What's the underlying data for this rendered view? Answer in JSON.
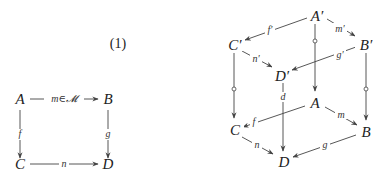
{
  "equation_number": "(1)",
  "square": {
    "nodes": {
      "A": {
        "label": "A",
        "x": 20,
        "y": 104
      },
      "B": {
        "label": "B",
        "x": 108,
        "y": 104
      },
      "C": {
        "label": "C",
        "x": 20,
        "y": 169
      },
      "D": {
        "label": "D",
        "x": 108,
        "y": 169
      }
    },
    "edges": {
      "m": {
        "from": "A",
        "to": "B",
        "label": "m∈𝓜"
      },
      "f": {
        "from": "A",
        "to": "C",
        "label": "f"
      },
      "g": {
        "from": "B",
        "to": "D",
        "label": "g"
      },
      "n": {
        "from": "C",
        "to": "D",
        "label": "n"
      }
    }
  },
  "cube": {
    "nodes": {
      "A1": {
        "label": "A′"
      },
      "B1": {
        "label": "B′"
      },
      "C1": {
        "label": "C′"
      },
      "D1": {
        "label": "D′"
      },
      "A": {
        "label": "A"
      },
      "B": {
        "label": "B"
      },
      "C": {
        "label": "C"
      },
      "D": {
        "label": "D"
      }
    },
    "edges": {
      "f1": {
        "from": "A′",
        "to": "C′",
        "label": "f′"
      },
      "m1": {
        "from": "A′",
        "to": "B′",
        "label": "m′"
      },
      "n1": {
        "from": "C′",
        "to": "D′",
        "label": "n′"
      },
      "g1": {
        "from": "B′",
        "to": "D′",
        "label": "g′"
      },
      "c": {
        "from": "C′",
        "to": "C",
        "label": "c",
        "mark": "circle"
      },
      "a": {
        "from": "A′",
        "to": "A",
        "label": "",
        "mark": "circle"
      },
      "b": {
        "from": "B′",
        "to": "B",
        "label": "b",
        "mark": "circle"
      },
      "d": {
        "from": "D′",
        "to": "D",
        "label": "d"
      },
      "f": {
        "from": "A",
        "to": "C",
        "label": "f"
      },
      "m": {
        "from": "A",
        "to": "B",
        "label": "m"
      },
      "n": {
        "from": "C",
        "to": "D",
        "label": "n"
      },
      "g": {
        "from": "B",
        "to": "D",
        "label": "g"
      }
    }
  }
}
